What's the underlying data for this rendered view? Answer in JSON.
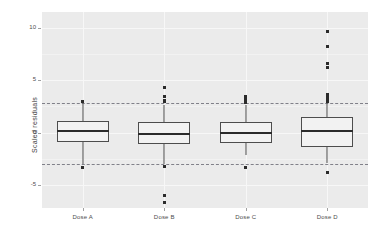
{
  "chart_data": {
    "type": "boxplot",
    "title": "",
    "xlabel": "",
    "ylabel": "Scaled residuals",
    "categories": [
      "Dose A",
      "Dose B",
      "Dose C",
      "Dose D"
    ],
    "ylim": [
      -7.2,
      11.5
    ],
    "yticks": [
      10,
      5,
      0,
      -5
    ],
    "ytick_labels": [
      "10",
      "5",
      "0",
      "-5"
    ],
    "grid": true,
    "legend": "none",
    "reference_lines": [
      {
        "value": 2.8,
        "style": "dashed",
        "color": "#6e6e78"
      },
      {
        "value": -3.0,
        "style": "dashed",
        "color": "#6e6e78"
      }
    ],
    "boxes": [
      {
        "name": "Dose A",
        "lower_whisker": -3.0,
        "q1": -0.9,
        "median": 0.15,
        "q3": 1.1,
        "upper_whisker": 2.8,
        "outliers": [
          3.0,
          -3.3
        ]
      },
      {
        "name": "Dose B",
        "lower_whisker": -3.0,
        "q1": -1.1,
        "median": -0.1,
        "q3": 1.0,
        "upper_whisker": 2.6,
        "outliers": [
          4.3,
          3.4,
          3.1,
          2.95,
          -3.2,
          -6.0,
          -6.7
        ]
      },
      {
        "name": "Dose C",
        "lower_whisker": -2.1,
        "q1": -1.0,
        "median": -0.05,
        "q3": 1.05,
        "upper_whisker": 2.65,
        "outliers": [
          3.45,
          3.15,
          2.9,
          -3.3
        ]
      },
      {
        "name": "Dose D",
        "lower_whisker": -2.9,
        "q1": -1.35,
        "median": 0.15,
        "q3": 1.5,
        "upper_whisker": 2.8,
        "outliers": [
          9.6,
          8.2,
          6.6,
          6.2,
          3.6,
          3.3,
          3.1,
          2.95,
          -3.8
        ]
      }
    ],
    "colors": {
      "panel_background": "#ebebeb",
      "grid": "#f7f7f7",
      "box_fill": "#f2f2f2",
      "box_border": "#4d4d4d",
      "median": "#2b2b2b",
      "outlier": "#2b2b2b",
      "reference_line": "#6e6e78",
      "axis_text": "#4d4d4d"
    }
  }
}
